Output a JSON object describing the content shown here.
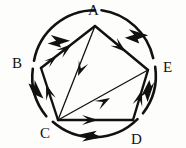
{
  "figure": {
    "type": "diagram",
    "stroke_color": "#111111",
    "background_color": "#fdfdfb",
    "canvas": {
      "width": 186,
      "height": 148
    },
    "circle": {
      "cx": 94,
      "cy": 72,
      "r": 62
    },
    "vertices": [
      {
        "id": "A",
        "label": "A",
        "x": 95,
        "y": 26,
        "label_x": 88,
        "label_y": 3
      },
      {
        "id": "B",
        "label": "B",
        "x": 41,
        "y": 68,
        "label_x": 12,
        "label_y": 56
      },
      {
        "id": "C",
        "label": "C",
        "x": 58,
        "y": 120,
        "label_x": 40,
        "label_y": 126
      },
      {
        "id": "D",
        "label": "D",
        "x": 133,
        "y": 120,
        "label_x": 131,
        "label_y": 132
      },
      {
        "id": "E",
        "label": "E",
        "x": 148,
        "y": 70,
        "label_x": 163,
        "label_y": 60
      }
    ],
    "arcs": [
      {
        "id": "arc-A-B",
        "from": "A",
        "to": "B",
        "direction": "A-to-B",
        "arrows": 1
      },
      {
        "id": "arc-B-C",
        "from": "B",
        "to": "C",
        "direction": "B-to-C",
        "arrows": 1
      },
      {
        "id": "arc-C-D",
        "from": "D",
        "to": "C",
        "direction": "D-to-C",
        "arrows": 1
      },
      {
        "id": "arc-D-E",
        "from": "E",
        "to": "D",
        "direction": "E-to-D",
        "arrows": 1
      },
      {
        "id": "arc-E-A",
        "from": "E",
        "to": "A",
        "direction": "E-to-A",
        "arrows": 1
      }
    ],
    "chords": [
      {
        "id": "chord-B-A",
        "from": "B",
        "to": "A",
        "arrow_at": "A",
        "style": "thick"
      },
      {
        "id": "chord-C-B",
        "from": "C",
        "to": "B",
        "arrow_at": "B",
        "style": "thick"
      },
      {
        "id": "chord-C-D",
        "from": "C",
        "to": "D",
        "arrow_at": "D",
        "style": "thick"
      },
      {
        "id": "chord-D-E",
        "from": "D",
        "to": "E",
        "arrow_at": "E",
        "style": "thick"
      },
      {
        "id": "chord-A-E",
        "from": "A",
        "to": "E",
        "arrow_at": "E",
        "style": "thick"
      },
      {
        "id": "chord-A-C",
        "from": "A",
        "to": "C",
        "arrow_at": "C",
        "style": "thin"
      },
      {
        "id": "chord-C-E",
        "from": "C",
        "to": "E",
        "arrow_at": "E",
        "style": "thin"
      }
    ]
  }
}
